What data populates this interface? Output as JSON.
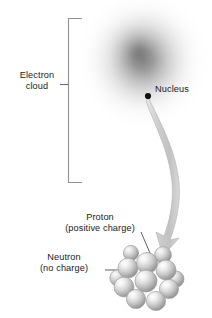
{
  "figure": {
    "type": "diagram",
    "background_color": "#ffffff"
  },
  "labels": {
    "electron_cloud": {
      "line1": "Electron",
      "line2": "cloud"
    },
    "nucleus": {
      "line1": "Nucleus"
    },
    "proton": {
      "line1": "Proton",
      "line2": "(positive charge)"
    },
    "neutron": {
      "line1": "Neutron",
      "line2": "(no charge)"
    }
  },
  "colors": {
    "text": "#1a1a1a",
    "bracket": "#8c8c8c",
    "leader_line": "#4d4d4d",
    "nucleus_dot": "#111111",
    "cloud_core": "#7d7d7d",
    "cloud_edge": "#ffffff",
    "arrow_fill": "#c9c9c9",
    "arrow_stroke": "#bdbdbd",
    "sphere_light": "#ffffff",
    "sphere_mid": "#c6c6c6",
    "sphere_dark": "#8a8a8a",
    "sphere_outline": "#9a9a9a"
  },
  "electron_cloud": {
    "center_x": 143,
    "center_y": 60,
    "radius_x": 68,
    "radius_y": 72,
    "shape": "radial-gradient"
  },
  "nucleus_dot": {
    "x": 148,
    "y": 96,
    "radius": 3.1
  },
  "bracket": {
    "x": 68,
    "top_y": 18,
    "bottom_y": 182,
    "arm_length": 14,
    "tick_y": 84,
    "tick_length": 9
  },
  "arrow": {
    "from_x": 149,
    "from_y": 99,
    "to_x": 164,
    "to_y": 250,
    "description": "curved magnifier arrow from nucleus to nucleon cluster"
  },
  "leaders": {
    "proton": {
      "x1": 141,
      "y1": 232,
      "x2": 152,
      "y2": 259
    },
    "neutron": {
      "x1": 105,
      "y1": 270,
      "x2": 124,
      "y2": 270
    }
  },
  "nucleon_cluster": {
    "count": 12,
    "spheres": [
      {
        "cx": 147,
        "cy": 263,
        "r": 10.5,
        "depth": 2
      },
      {
        "cx": 128,
        "cy": 268,
        "r": 10.0,
        "depth": 1
      },
      {
        "cx": 166,
        "cy": 270,
        "r": 10.0,
        "depth": 1
      },
      {
        "cx": 124,
        "cy": 287,
        "r": 10.0,
        "depth": 1
      },
      {
        "cx": 169,
        "cy": 289,
        "r": 9.6,
        "depth": 1
      },
      {
        "cx": 136,
        "cy": 299,
        "r": 9.6,
        "depth": 1
      },
      {
        "cx": 156,
        "cy": 301,
        "r": 9.6,
        "depth": 1
      },
      {
        "cx": 146,
        "cy": 281,
        "r": 11.0,
        "depth": 3
      },
      {
        "cx": 163,
        "cy": 255,
        "r": 8.4,
        "depth": 0
      },
      {
        "cx": 131,
        "cy": 253,
        "r": 7.6,
        "depth": 0
      },
      {
        "cx": 118,
        "cy": 278,
        "r": 8.2,
        "depth": 0
      },
      {
        "cx": 176,
        "cy": 279,
        "r": 8.0,
        "depth": 0
      }
    ]
  }
}
